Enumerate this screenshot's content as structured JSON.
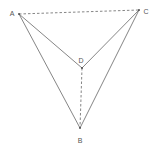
{
  "diagram": {
    "type": "geometry-figure",
    "points": [
      {
        "id": "A",
        "label": "A",
        "x": 19,
        "y": 14,
        "label_x": 12,
        "label_y": 14
      },
      {
        "id": "B",
        "label": "B",
        "x": 80,
        "y": 128,
        "label_x": 80,
        "label_y": 141
      },
      {
        "id": "C",
        "label": "C",
        "x": 139,
        "y": 10,
        "label_x": 146,
        "label_y": 12
      },
      {
        "id": "D",
        "label": "D",
        "x": 82,
        "y": 68,
        "label_x": 81,
        "label_y": 61
      }
    ],
    "segments": [
      {
        "from": "A",
        "to": "C",
        "style": "dashed"
      },
      {
        "from": "A",
        "to": "D",
        "style": "solid"
      },
      {
        "from": "D",
        "to": "C",
        "style": "solid"
      },
      {
        "from": "A",
        "to": "B",
        "style": "solid"
      },
      {
        "from": "C",
        "to": "B",
        "style": "solid"
      },
      {
        "from": "D",
        "to": "B",
        "style": "dashed"
      }
    ],
    "colors": {
      "line": "#777777",
      "label": "#555555",
      "background": "#ffffff"
    }
  }
}
